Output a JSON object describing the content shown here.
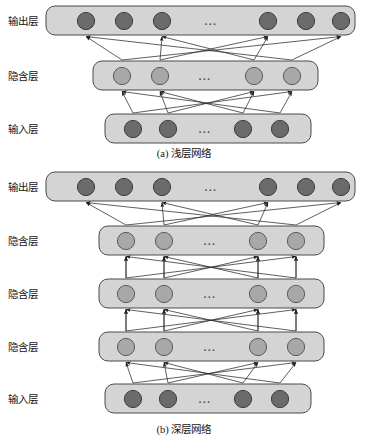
{
  "figure": {
    "background_color": "#ffffff",
    "bar_fill": "#d4d4d4",
    "bar_stroke": "#4a4a4a",
    "node_dark_fill": "#6b6b6b",
    "node_dark_stroke": "#3c3c3c",
    "node_light_fill": "#a8a8a8",
    "node_light_stroke": "#5a5a5a",
    "edge_color": "#2a2a2a",
    "ellipsis": "..."
  },
  "labels": {
    "output_layer": "输出层",
    "hidden_layer": "隐含层",
    "input_layer": "输入层"
  },
  "captions": {
    "shallow": "(a) 浅层网络",
    "deep": "(b) 深层网络"
  },
  "panel_a": {
    "name": "shallow-network",
    "caption": "(a) 浅层网络",
    "layers": [
      {
        "id": "a-output",
        "role": "output",
        "label": "输出层",
        "node_count": 6,
        "node_style": "dark",
        "ellipsis": "...",
        "bar": {
          "x": 46,
          "y": 6,
          "w": 309,
          "h": 29
        },
        "nodes_x": [
          86,
          124,
          162,
          268,
          306,
          341
        ],
        "node_y": 21,
        "ellipsis_x": 211
      },
      {
        "id": "a-hidden",
        "role": "hidden",
        "label": "隐含层",
        "node_count": 4,
        "node_style": "light",
        "ellipsis": "...",
        "bar": {
          "x": 93,
          "y": 61,
          "w": 225,
          "h": 29
        },
        "nodes_x": [
          122,
          160,
          254,
          292
        ],
        "node_y": 76,
        "ellipsis_x": 205
      },
      {
        "id": "a-input",
        "role": "input",
        "label": "输入层",
        "node_count": 4,
        "node_style": "dark",
        "ellipsis": "...",
        "bar": {
          "x": 105,
          "y": 114,
          "w": 206,
          "h": 29
        },
        "nodes_x": [
          133,
          168,
          243,
          280
        ],
        "node_y": 129,
        "ellipsis_x": 205
      }
    ],
    "label_positions": [
      {
        "text": "输出层",
        "x": 8,
        "y": 25
      },
      {
        "text": "隐含层",
        "x": 8,
        "y": 80
      },
      {
        "text": "输入层",
        "x": 8,
        "y": 133
      }
    ],
    "caption_position": {
      "x": 184,
      "y": 157
    }
  },
  "panel_b": {
    "name": "deep-network",
    "caption": "(b) 深层网络",
    "layers": [
      {
        "id": "b-output",
        "role": "output",
        "label": "输出层",
        "node_count": 6,
        "node_style": "dark",
        "ellipsis": "...",
        "bar": {
          "x": 46,
          "y": 172,
          "w": 309,
          "h": 29
        },
        "nodes_x": [
          86,
          124,
          162,
          268,
          306,
          341
        ],
        "node_y": 187,
        "ellipsis_x": 211
      },
      {
        "id": "b-hidden-3",
        "role": "hidden",
        "label": "隐含层",
        "node_count": 4,
        "node_style": "light",
        "ellipsis": "...",
        "bar": {
          "x": 99,
          "y": 226,
          "w": 225,
          "h": 29
        },
        "nodes_x": [
          126,
          164,
          258,
          296
        ],
        "node_y": 241,
        "ellipsis_x": 210
      },
      {
        "id": "b-hidden-2",
        "role": "hidden",
        "label": "隐含层",
        "node_count": 4,
        "node_style": "light",
        "ellipsis": "...",
        "bar": {
          "x": 99,
          "y": 279,
          "w": 225,
          "h": 29
        },
        "nodes_x": [
          126,
          164,
          258,
          296
        ],
        "node_y": 294,
        "ellipsis_x": 210
      },
      {
        "id": "b-hidden-1",
        "role": "hidden",
        "label": "隐含层",
        "node_count": 4,
        "node_style": "light",
        "ellipsis": "...",
        "bar": {
          "x": 99,
          "y": 332,
          "w": 225,
          "h": 29
        },
        "nodes_x": [
          126,
          164,
          258,
          296
        ],
        "node_y": 347,
        "ellipsis_x": 210
      },
      {
        "id": "b-input",
        "role": "input",
        "label": "输入层",
        "node_count": 4,
        "node_style": "dark",
        "ellipsis": "...",
        "bar": {
          "x": 105,
          "y": 384,
          "w": 206,
          "h": 29
        },
        "nodes_x": [
          133,
          168,
          243,
          280
        ],
        "node_y": 399,
        "ellipsis_x": 205
      }
    ],
    "label_positions": [
      {
        "text": "输出层",
        "x": 8,
        "y": 191
      },
      {
        "text": "隐含层",
        "x": 8,
        "y": 245
      },
      {
        "text": "隐含层",
        "x": 8,
        "y": 298
      },
      {
        "text": "隐含层",
        "x": 8,
        "y": 351
      },
      {
        "text": "输入层",
        "x": 8,
        "y": 403
      }
    ],
    "caption_position": {
      "x": 184,
      "y": 433
    }
  },
  "connections": {
    "description": "Directed upward arrows fully/partially connecting adjacent layers",
    "panel_a": [
      {
        "from_layer": "a-hidden",
        "to_layer": "a-output"
      },
      {
        "from_layer": "a-input",
        "to_layer": "a-hidden"
      }
    ],
    "panel_b": [
      {
        "from_layer": "b-hidden-3",
        "to_layer": "b-output"
      },
      {
        "from_layer": "b-hidden-2",
        "to_layer": "b-hidden-3"
      },
      {
        "from_layer": "b-hidden-1",
        "to_layer": "b-hidden-2"
      },
      {
        "from_layer": "b-input",
        "to_layer": "b-hidden-1"
      }
    ]
  }
}
